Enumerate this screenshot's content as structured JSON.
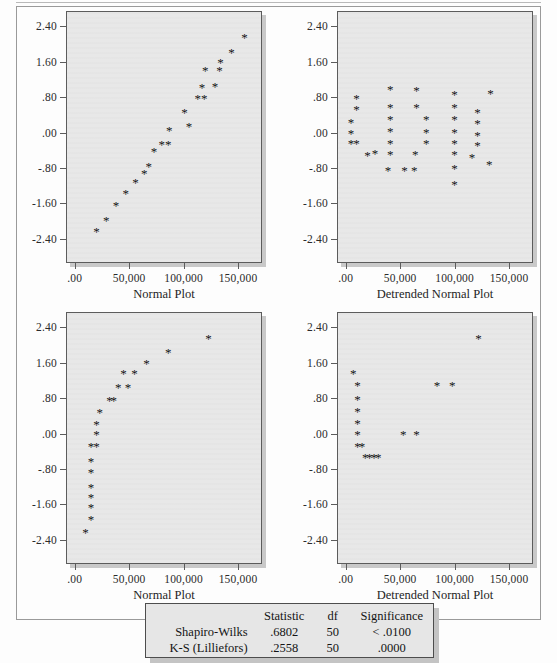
{
  "axes": {
    "y_ticks": [
      "2.40",
      "1.60",
      ".80",
      ".00",
      "-.80",
      "-1.60",
      "-2.40"
    ],
    "x_ticks": [
      ".00",
      "50,000",
      "100,000",
      "150,000"
    ],
    "y_values": [
      2.4,
      1.6,
      0.8,
      0.0,
      -0.8,
      -1.6,
      -2.4
    ],
    "x_values": [
      0,
      50000,
      100000,
      150000
    ]
  },
  "panels": [
    {
      "id": "top-left",
      "axis_title": "Normal Plot"
    },
    {
      "id": "top-right",
      "axis_title": "Detrended Normal Plot"
    },
    {
      "id": "bottom-left",
      "axis_title": "Normal Plot"
    },
    {
      "id": "bottom-right",
      "axis_title": "Detrended Normal Plot"
    }
  ],
  "stats": {
    "headers": [
      "",
      "Statistic",
      "df",
      "Significance"
    ],
    "rows": [
      {
        "name": "Shapiro-Wilks",
        "statistic": ".6802",
        "df": "50",
        "significance": "< .0100"
      },
      {
        "name": "K-S (Lilliefors)",
        "statistic": ".2558",
        "df": "50",
        "significance": ".0000"
      }
    ]
  },
  "chart_data": [
    {
      "type": "scatter",
      "title": "Normal Plot",
      "panel": "top-left",
      "xlabel": "Normal Plot",
      "ylabel": "",
      "xlim": [
        -8000,
        172000
      ],
      "ylim": [
        -2.95,
        2.75
      ],
      "xticks": [
        0,
        50000,
        100000,
        150000
      ],
      "yticks": [
        -2.4,
        -1.6,
        -0.8,
        0.0,
        0.8,
        1.6,
        2.4
      ],
      "grid": false,
      "legend": null,
      "marker": "*",
      "points": [
        {
          "x": 19000,
          "y": -2.21
        },
        {
          "x": 28000,
          "y": -1.97
        },
        {
          "x": 37000,
          "y": -1.62
        },
        {
          "x": 46000,
          "y": -1.35
        },
        {
          "x": 55000,
          "y": -1.1
        },
        {
          "x": 63000,
          "y": -0.9
        },
        {
          "x": 67000,
          "y": -0.74
        },
        {
          "x": 72000,
          "y": -0.4
        },
        {
          "x": 79000,
          "y": -0.24
        },
        {
          "x": 85000,
          "y": -0.24
        },
        {
          "x": 86000,
          "y": 0.07
        },
        {
          "x": 100000,
          "y": 0.48
        },
        {
          "x": 104000,
          "y": 0.17
        },
        {
          "x": 112000,
          "y": 0.8
        },
        {
          "x": 118000,
          "y": 0.8
        },
        {
          "x": 116000,
          "y": 1.05
        },
        {
          "x": 128000,
          "y": 1.07
        },
        {
          "x": 119000,
          "y": 1.42
        },
        {
          "x": 132000,
          "y": 1.42
        },
        {
          "x": 133000,
          "y": 1.6
        },
        {
          "x": 143000,
          "y": 1.83
        },
        {
          "x": 155000,
          "y": 2.17
        }
      ]
    },
    {
      "type": "scatter",
      "title": "Detrended Normal Plot",
      "panel": "top-right",
      "xlabel": "Detrended Normal Plot",
      "ylabel": "",
      "xlim": [
        -8000,
        172000
      ],
      "ylim": [
        -2.95,
        2.75
      ],
      "xticks": [
        0,
        50000,
        100000,
        150000
      ],
      "yticks": [
        -2.4,
        -1.6,
        -0.8,
        0.0,
        0.8,
        1.6,
        2.4
      ],
      "grid": false,
      "legend": null,
      "marker": "*",
      "points": [
        {
          "x": 4000,
          "y": 0.25
        },
        {
          "x": 4000,
          "y": 0.0
        },
        {
          "x": 4000,
          "y": -0.22
        },
        {
          "x": 9000,
          "y": -0.22
        },
        {
          "x": 9000,
          "y": 0.8
        },
        {
          "x": 9000,
          "y": 0.54
        },
        {
          "x": 19000,
          "y": -0.5
        },
        {
          "x": 26000,
          "y": -0.46
        },
        {
          "x": 40000,
          "y": 1.0
        },
        {
          "x": 40000,
          "y": 0.6
        },
        {
          "x": 40000,
          "y": 0.32
        },
        {
          "x": 40000,
          "y": 0.05
        },
        {
          "x": 40000,
          "y": -0.22
        },
        {
          "x": 40000,
          "y": -0.47
        },
        {
          "x": 38000,
          "y": -0.84
        },
        {
          "x": 53000,
          "y": -0.83
        },
        {
          "x": 62000,
          "y": -0.84
        },
        {
          "x": 64000,
          "y": 0.98
        },
        {
          "x": 64000,
          "y": 0.6
        },
        {
          "x": 63000,
          "y": -0.47
        },
        {
          "x": 73000,
          "y": 0.32
        },
        {
          "x": 73000,
          "y": 0.02
        },
        {
          "x": 73000,
          "y": -0.22
        },
        {
          "x": 99000,
          "y": 0.88
        },
        {
          "x": 99000,
          "y": 0.6
        },
        {
          "x": 99000,
          "y": 0.32
        },
        {
          "x": 99000,
          "y": 0.02
        },
        {
          "x": 99000,
          "y": -0.22
        },
        {
          "x": 99000,
          "y": -0.47
        },
        {
          "x": 99000,
          "y": -0.79
        },
        {
          "x": 99000,
          "y": -1.15
        },
        {
          "x": 120000,
          "y": 0.47
        },
        {
          "x": 120000,
          "y": 0.22
        },
        {
          "x": 120000,
          "y": -0.05
        },
        {
          "x": 120000,
          "y": -0.28
        },
        {
          "x": 115000,
          "y": -0.55
        },
        {
          "x": 132000,
          "y": 0.91
        },
        {
          "x": 131000,
          "y": -0.7
        }
      ]
    },
    {
      "type": "scatter",
      "title": "Normal Plot",
      "panel": "bottom-left",
      "xlabel": "Normal Plot",
      "ylabel": "",
      "xlim": [
        -8000,
        172000
      ],
      "ylim": [
        -2.95,
        2.75
      ],
      "xticks": [
        0,
        50000,
        100000,
        150000
      ],
      "yticks": [
        -2.4,
        -1.6,
        -0.8,
        0.0,
        0.8,
        1.6,
        2.4
      ],
      "grid": false,
      "legend": null,
      "marker": "*",
      "points": [
        {
          "x": 9000,
          "y": -2.21
        },
        {
          "x": 14000,
          "y": -1.92
        },
        {
          "x": 14000,
          "y": -1.65
        },
        {
          "x": 14000,
          "y": -1.43
        },
        {
          "x": 14000,
          "y": -1.2
        },
        {
          "x": 14000,
          "y": -0.86
        },
        {
          "x": 14000,
          "y": -0.6
        },
        {
          "x": 14000,
          "y": -0.27
        },
        {
          "x": 19000,
          "y": -0.27
        },
        {
          "x": 19000,
          "y": 0.0
        },
        {
          "x": 19000,
          "y": 0.22
        },
        {
          "x": 22000,
          "y": 0.5
        },
        {
          "x": 31000,
          "y": 0.78
        },
        {
          "x": 35000,
          "y": 0.78
        },
        {
          "x": 39000,
          "y": 1.06
        },
        {
          "x": 48000,
          "y": 1.06
        },
        {
          "x": 44000,
          "y": 1.38
        },
        {
          "x": 54000,
          "y": 1.38
        },
        {
          "x": 65000,
          "y": 1.6
        },
        {
          "x": 85000,
          "y": 1.86
        },
        {
          "x": 122000,
          "y": 2.17
        }
      ]
    },
    {
      "type": "scatter",
      "title": "Detrended Normal Plot",
      "panel": "bottom-right",
      "xlabel": "Detrended Normal Plot",
      "ylabel": "",
      "xlim": [
        -8000,
        172000
      ],
      "ylim": [
        -2.95,
        2.75
      ],
      "xticks": [
        0,
        50000,
        100000,
        150000
      ],
      "yticks": [
        -2.4,
        -1.6,
        -0.8,
        0.0,
        0.8,
        1.6,
        2.4
      ],
      "grid": false,
      "legend": null,
      "marker": "*",
      "points": [
        {
          "x": 6000,
          "y": 1.38
        },
        {
          "x": 10000,
          "y": 1.1
        },
        {
          "x": 10000,
          "y": 0.8
        },
        {
          "x": 10000,
          "y": 0.53
        },
        {
          "x": 10000,
          "y": 0.25
        },
        {
          "x": 10000,
          "y": 0.0
        },
        {
          "x": 10000,
          "y": -0.26
        },
        {
          "x": 14000,
          "y": -0.26
        },
        {
          "x": 17000,
          "y": -0.52
        },
        {
          "x": 21000,
          "y": -0.52
        },
        {
          "x": 25000,
          "y": -0.52
        },
        {
          "x": 29000,
          "y": -0.52
        },
        {
          "x": 52000,
          "y": 0.0
        },
        {
          "x": 64000,
          "y": 0.0
        },
        {
          "x": 83000,
          "y": 1.1
        },
        {
          "x": 97000,
          "y": 1.1
        },
        {
          "x": 121000,
          "y": 2.17
        }
      ]
    }
  ]
}
